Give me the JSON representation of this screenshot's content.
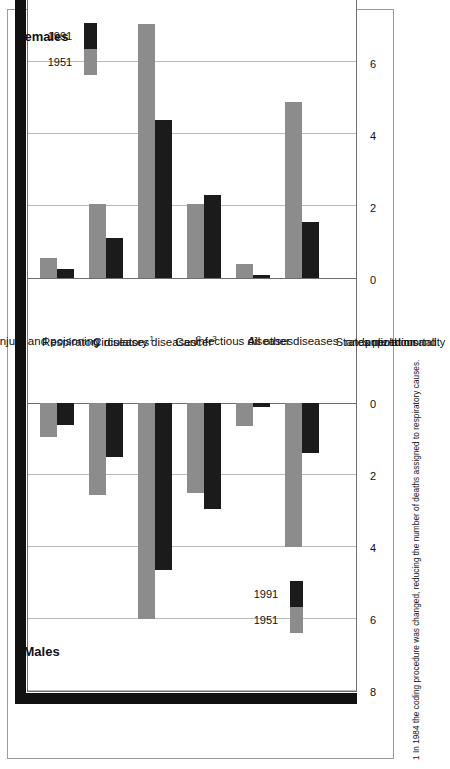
{
  "chart_data": {
    "type": "bar",
    "title": "",
    "orientation": "horizontal-pyramid",
    "xlabel": "Standardized mortality rates per thousand population",
    "ylabel": "",
    "xlim": [
      0,
      8
    ],
    "ticks": [
      "0",
      "2",
      "4",
      "6",
      "8"
    ],
    "grid": true,
    "legend_position": "inside",
    "panels": [
      "Males",
      "Females"
    ],
    "categories": [
      "Injury and poisoning",
      "Respiratory diseases",
      "Circulatory diseases",
      "Cancer",
      "Infectious diseases",
      "All other diseases"
    ],
    "category_superscripts": [
      "",
      "1",
      "2",
      "3",
      "",
      ""
    ],
    "series": [
      {
        "name": "1951",
        "panel": "Males",
        "values": [
          0.95,
          2.55,
          6.0,
          2.5,
          0.65,
          4.0
        ]
      },
      {
        "name": "1991",
        "panel": "Males",
        "values": [
          0.6,
          1.5,
          4.65,
          2.95,
          0.1,
          1.4
        ]
      },
      {
        "name": "1951",
        "panel": "Females",
        "values": [
          0.55,
          2.05,
          7.05,
          2.05,
          0.4,
          4.9
        ]
      },
      {
        "name": "1991",
        "panel": "Females",
        "values": [
          0.25,
          1.1,
          4.4,
          2.3,
          0.08,
          1.55
        ]
      }
    ]
  },
  "colors": {
    "series_1951": "#8c8c8c",
    "series_1991": "#1b1b1b",
    "gridline": "#b9b9b9",
    "frame": "#6e6e6e",
    "shadow": "#111111",
    "background": "#ffffff"
  },
  "panels": {
    "males": {
      "title": "Males"
    },
    "females": {
      "title": "Females"
    }
  },
  "legend": {
    "males": {
      "label_1951": "1951",
      "label_1991": "1991"
    },
    "females": {
      "label_1951": "1951",
      "label_1991": "1991"
    }
  },
  "axis": {
    "ticks_males": [
      "0",
      "2",
      "4",
      "6",
      "8"
    ],
    "ticks_females": [
      "0",
      "2",
      "4",
      "6",
      "8"
    ],
    "caption_line1": "Standardized mortality",
    "caption_line2": "rates per thousand",
    "caption_line3": "population",
    "caption_zero_left": "0",
    "caption_zero_right": "0"
  },
  "categories": [
    {
      "label": "Injury and poisoning",
      "sup": ""
    },
    {
      "label": "Respiratory diseases",
      "sup": "1"
    },
    {
      "label": "Circulatory diseases",
      "sup": "2"
    },
    {
      "label": "Cancer",
      "sup": "3"
    },
    {
      "label": "Infectious diseases",
      "sup": ""
    },
    {
      "label": "All other diseases",
      "sup": ""
    }
  ],
  "footnotes": [
    {
      "marker": "1",
      "text": "1 In 1984 the coding procedure was changed, reducing the number of deaths assigned to respiratory causes."
    }
  ]
}
